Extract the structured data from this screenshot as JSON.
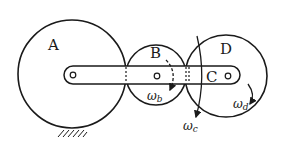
{
  "diagram": {
    "stroke_color": "#1a1a1a",
    "labels": {
      "A": "A",
      "B": "B",
      "C": "C",
      "D": "D",
      "omega_b": "ω",
      "omega_b_sub": "b",
      "omega_c": "ω",
      "omega_c_sub": "c",
      "omega_d": "ω",
      "omega_d_sub": "d"
    },
    "components": {
      "gear_A": {
        "cx": 71,
        "cy": 74,
        "r": 54,
        "fixed": true
      },
      "gear_B": {
        "cx": 156,
        "cy": 75,
        "r": 30
      },
      "gear_D": {
        "cx": 226,
        "cy": 76,
        "r": 41
      },
      "arm": {
        "from": "A",
        "to": "C"
      }
    }
  }
}
